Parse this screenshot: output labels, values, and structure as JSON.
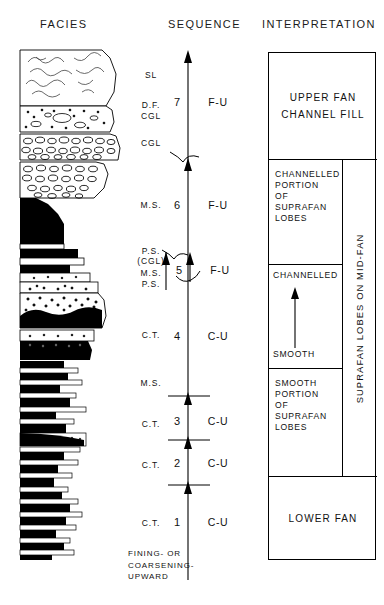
{
  "headers": {
    "facies": "FACIES",
    "sequence": "SEQUENCE",
    "interpretation": "INTERPRETATION"
  },
  "facies_labels": [
    {
      "text": "SL",
      "top": 70
    },
    {
      "text": "D.F.",
      "top": 100
    },
    {
      "text": "CGL",
      "top": 111
    },
    {
      "text": "CGL",
      "top": 138
    },
    {
      "text": "M.S.",
      "top": 200
    },
    {
      "text": "P.S.",
      "top": 246
    },
    {
      "text": "(CGL)",
      "top": 256
    },
    {
      "text": "M.S.",
      "top": 268
    },
    {
      "text": "P.S.",
      "top": 279
    },
    {
      "text": "C.T.",
      "top": 330
    },
    {
      "text": "M.S.",
      "top": 378
    },
    {
      "text": "C.T.",
      "top": 419
    },
    {
      "text": "C.T.",
      "top": 460
    },
    {
      "text": "C.T.",
      "top": 518
    }
  ],
  "sequence": {
    "axis_x": 188,
    "axis_top": 55,
    "axis_bottom": 580,
    "units": [
      {
        "number": "7",
        "trend": "F-U",
        "label_top": 96,
        "num_left": 166,
        "trend_left": 196
      },
      {
        "number": "6",
        "trend": "F-U",
        "label_top": 199,
        "num_left": 166,
        "trend_left": 196
      },
      {
        "number": "5",
        "trend": "F-U",
        "label_top": 264,
        "num_left": 168,
        "trend_left": 198
      },
      {
        "number": "4",
        "trend": "C-U",
        "label_top": 330,
        "num_left": 166,
        "trend_left": 196
      },
      {
        "number": "3",
        "trend": "C-U",
        "label_top": 415,
        "num_left": 166,
        "trend_left": 196
      },
      {
        "number": "2",
        "trend": "C-U",
        "label_top": 457,
        "num_left": 166,
        "trend_left": 196
      },
      {
        "number": "1",
        "trend": "C-U",
        "label_top": 516,
        "num_left": 166,
        "trend_left": 196
      }
    ],
    "legend_lines": [
      "FINING-  OR",
      "COARSENING-",
      "UPWARD"
    ]
  },
  "interpretation": {
    "boxes": [
      {
        "name": "upper-fan-channel-fill",
        "top": 0,
        "height": 106,
        "width": 108,
        "style": "center",
        "lines": [
          "UPPER FAN",
          "CHANNEL  FILL"
        ]
      },
      {
        "name": "channelled-portion-suprafan-lobes",
        "top": 106,
        "height": 105,
        "width": 73,
        "style": "left",
        "lines": [
          "CHANNELLED",
          "PORTION",
          "OF",
          "SUPRAFAN",
          "LOBES"
        ]
      },
      {
        "name": "channelled-to-smooth",
        "top": 211,
        "height": 104,
        "width": 73,
        "style": "arrow",
        "lines": [
          "CHANNELLED",
          "SMOOTH"
        ]
      },
      {
        "name": "smooth-portion-suprafan-lobes",
        "top": 315,
        "height": 108,
        "width": 73,
        "style": "left",
        "lines": [
          "SMOOTH",
          "PORTION",
          "OF",
          "SUPRAFAN",
          "LOBES"
        ]
      },
      {
        "name": "lower-fan",
        "top": 423,
        "height": 85,
        "width": 108,
        "style": "center",
        "lines": [
          "LOWER FAN"
        ]
      }
    ],
    "vertical_label": "SUPRAFAN LOBES ON MID-FAN"
  },
  "colors": {
    "ink": "#000000",
    "background": "#ffffff",
    "text": "#111111"
  }
}
